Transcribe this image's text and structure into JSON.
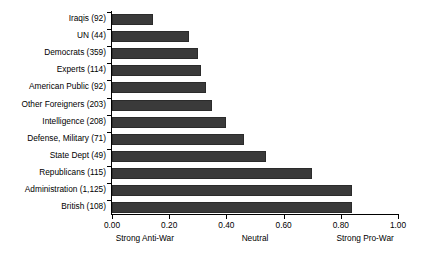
{
  "chart_data": {
    "type": "bar",
    "orientation": "horizontal",
    "title": "",
    "xlabel": "",
    "ylabel": "",
    "xlim": [
      0.0,
      1.0
    ],
    "xticks": [
      "0.00",
      "0.20",
      "0.40",
      "0.60",
      "0.80",
      "1.00"
    ],
    "xtick_values": [
      0.0,
      0.2,
      0.4,
      0.6,
      0.8,
      1.0
    ],
    "grid": false,
    "legend": null,
    "categories": [
      "Iraqis (92)",
      "UN (44)",
      "Democrats (359)",
      "Experts (114)",
      "American Public (92)",
      "Other Foreigners (203)",
      "Intelligence (208)",
      "Defense, Military (71)",
      "State Dept (49)",
      "Republicans (115)",
      "Administration (1,125)",
      "British (108)"
    ],
    "values": [
      0.145,
      0.27,
      0.3,
      0.31,
      0.33,
      0.35,
      0.4,
      0.46,
      0.54,
      0.7,
      0.84,
      0.84
    ],
    "annotations": [
      {
        "text": "Strong Anti-War",
        "at": 0.115
      },
      {
        "text": "Neutral",
        "at": 0.5
      },
      {
        "text": "Strong Pro-War",
        "at": 0.885
      }
    ],
    "bar_color": "#3a3a3a",
    "axis_color": "#000000"
  }
}
